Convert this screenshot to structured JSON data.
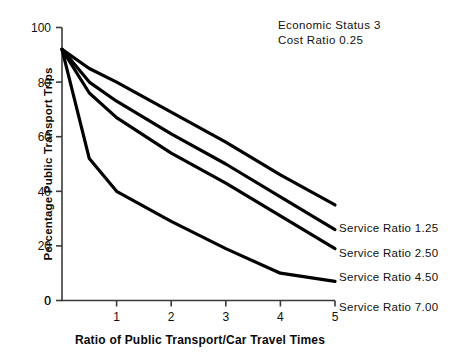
{
  "chart_data": {
    "type": "line",
    "title": "",
    "xlabel": "Ratio of Public Transport/Car Travel Times",
    "ylabel": "Percentage Public Transport Trips",
    "xlim": [
      0,
      5
    ],
    "ylim": [
      0,
      100
    ],
    "xticks": [
      "0",
      "1",
      "2",
      "3",
      "4",
      "5"
    ],
    "yticks": [
      "0",
      "20",
      "40",
      "60",
      "80",
      "100"
    ],
    "grid": false,
    "legend_position": "inline-right-end-labels",
    "annotations": [
      "Economic Status 3",
      "Cost Ratio 0.25"
    ],
    "series": [
      {
        "name": "Service Ratio 1.25",
        "x": [
          0,
          0.5,
          1,
          2,
          3,
          4,
          5
        ],
        "values": [
          92,
          85,
          80,
          69,
          58,
          46,
          35
        ]
      },
      {
        "name": "Service Ratio 2.50",
        "x": [
          0,
          0.5,
          1,
          2,
          3,
          4,
          5
        ],
        "values": [
          92,
          80,
          73,
          61,
          50,
          38,
          26
        ]
      },
      {
        "name": "Service Ratio 4.50",
        "x": [
          0,
          0.5,
          1,
          2,
          3,
          4,
          5
        ],
        "values": [
          92,
          76,
          67,
          54,
          43,
          31,
          19
        ]
      },
      {
        "name": "Service Ratio 7.00",
        "x": [
          0,
          0.5,
          1,
          2,
          3,
          4,
          5
        ],
        "values": [
          92,
          52,
          40,
          29,
          19,
          10,
          7
        ]
      }
    ]
  },
  "annotation": {
    "line1": "Economic Status 3",
    "line2": "Cost Ratio 0.25"
  },
  "axes": {
    "x_title": "Ratio of Public Transport/Car Travel Times",
    "y_title": "Percentage Public Transport Trips",
    "x_ticks": [
      "0",
      "1",
      "2",
      "3",
      "4",
      "5"
    ],
    "y_ticks": [
      "0",
      "20",
      "40",
      "60",
      "80",
      "100"
    ]
  },
  "series_labels": [
    "Service Ratio 1.25",
    "Service Ratio 2.50",
    "Service Ratio 4.50",
    "Service Ratio 7.00"
  ],
  "colors": {
    "line": "#000000",
    "axis": "#3a3a3a",
    "text": "#101010",
    "background": "#ffffff"
  }
}
